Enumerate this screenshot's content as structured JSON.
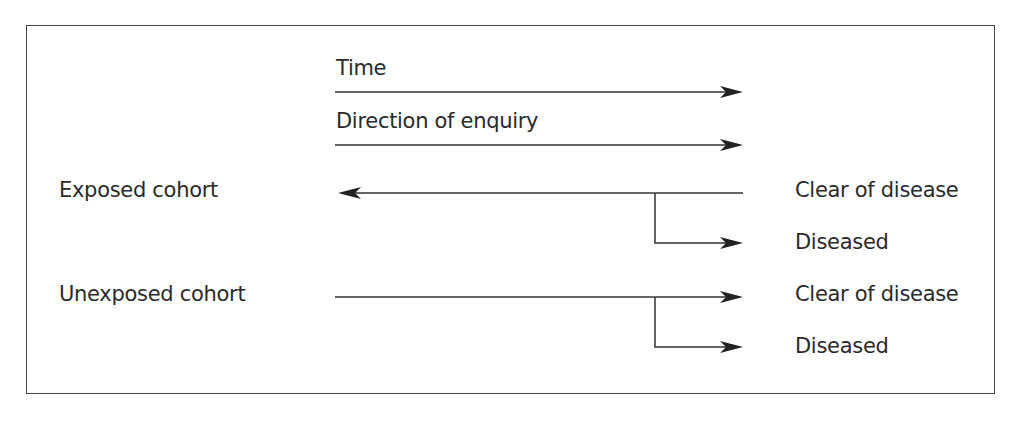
{
  "diagram": {
    "type": "cohort-study-design",
    "header_labels": {
      "time": "Time",
      "direction": "Direction of enquiry"
    },
    "cohorts": [
      {
        "label": "Exposed cohort",
        "outcomes": [
          "Clear of disease",
          "Diseased"
        ]
      },
      {
        "label": "Unexposed cohort",
        "outcomes": [
          "Clear of disease",
          "Diseased"
        ]
      }
    ]
  }
}
